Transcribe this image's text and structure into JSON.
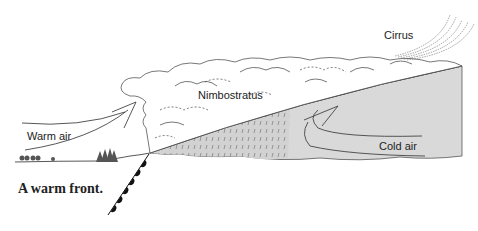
{
  "diagram": {
    "title": "A warm front.",
    "labels": {
      "cirrus": "Cirrus",
      "nimbostratus": "Nimbostratus",
      "warm_air": "Warm air",
      "cold_air": "Cold air"
    },
    "colors": {
      "cold_air_fill": "#d9d9d9",
      "rain_fill": "#cfcfcf",
      "line": "#444444",
      "front_symbol": "#111111",
      "background": "#ffffff"
    },
    "elements": [
      "cirrus-streaks",
      "nimbostratus-cloud-mass",
      "warm-air-arrow",
      "cold-air-wedge",
      "cold-air-circulation-arrow",
      "rain-region",
      "warm-front-line-with-semicircles",
      "ground-line-with-trees"
    ]
  }
}
